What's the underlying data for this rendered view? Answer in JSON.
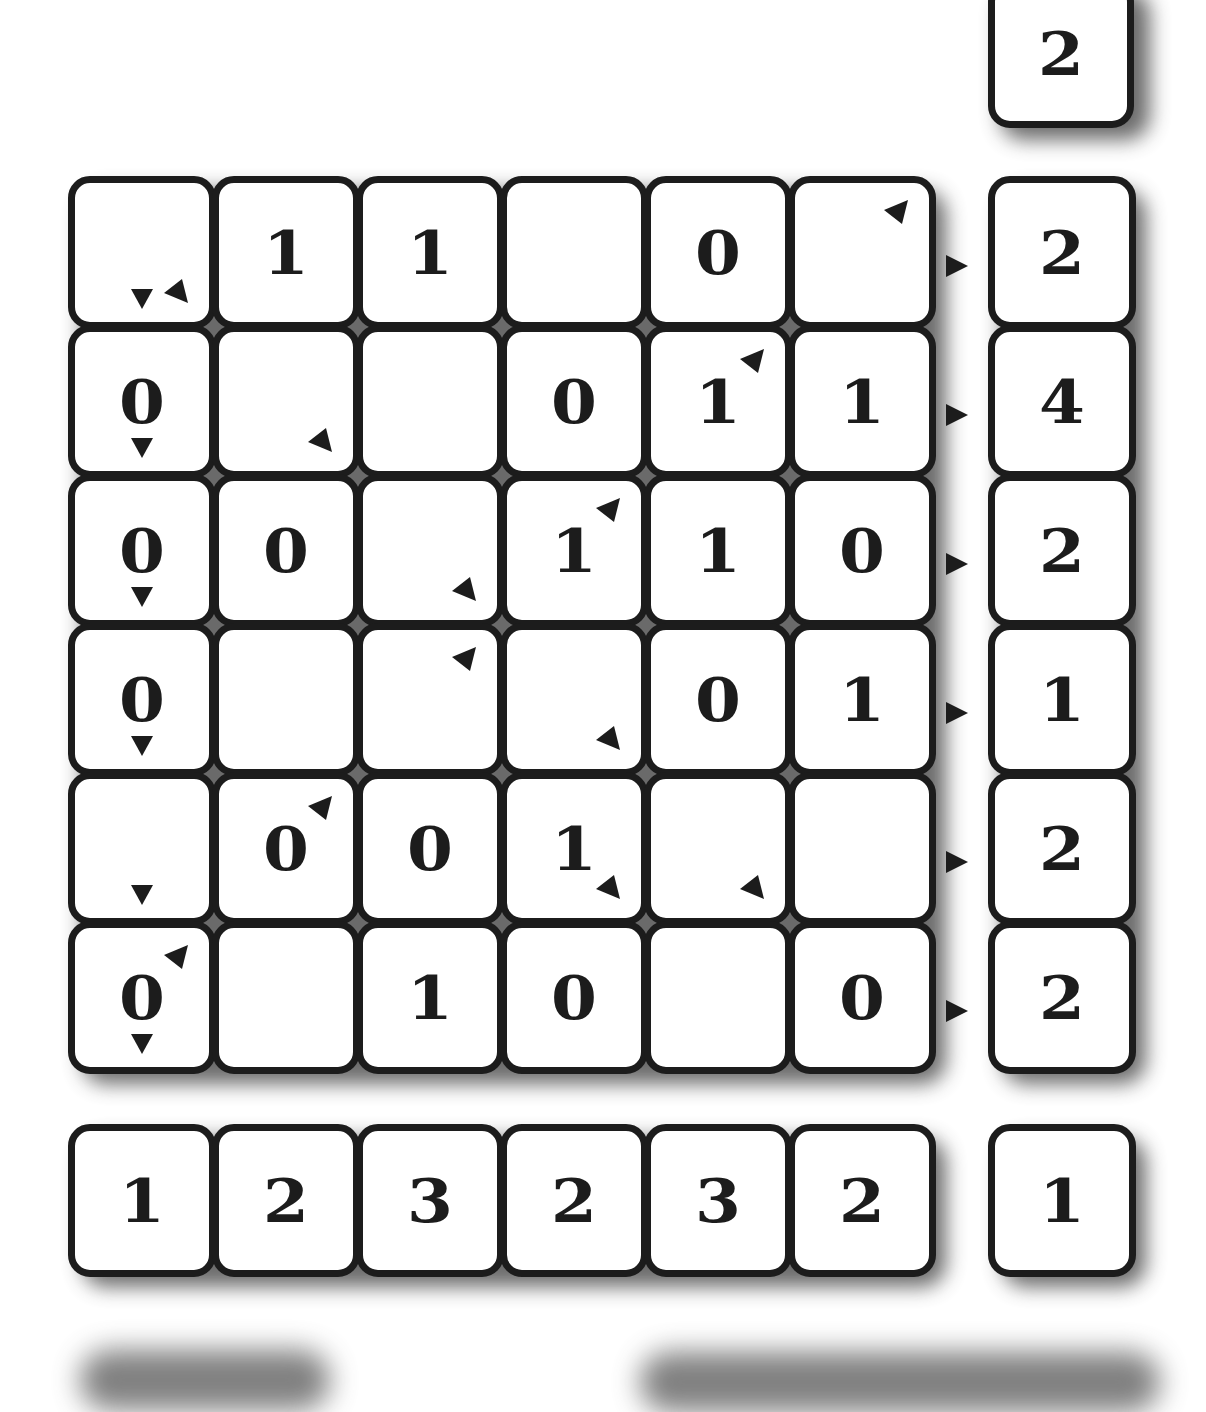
{
  "puzzle": {
    "rows": 6,
    "cols": 6,
    "grid": [
      [
        "",
        "1",
        "1",
        "",
        "0",
        ""
      ],
      [
        "0",
        "",
        "",
        "0",
        "1",
        "1"
      ],
      [
        "0",
        "0",
        "",
        "1",
        "1",
        "0"
      ],
      [
        "0",
        "",
        "",
        "",
        "0",
        "1"
      ],
      [
        "",
        "0",
        "0",
        "1",
        "",
        ""
      ],
      [
        "0",
        "",
        "1",
        "0",
        "",
        "0"
      ]
    ],
    "markers": [
      [
        [
          "down",
          "br"
        ],
        [],
        [],
        [],
        [],
        [
          "tr"
        ]
      ],
      [
        [
          "down"
        ],
        [
          "br"
        ],
        [],
        [],
        [
          "tr"
        ],
        []
      ],
      [
        [
          "down"
        ],
        [],
        [
          "br"
        ],
        [
          "tr"
        ],
        [],
        []
      ],
      [
        [
          "down"
        ],
        [],
        [
          "tr"
        ],
        [
          "br"
        ],
        [],
        []
      ],
      [
        [
          "down"
        ],
        [
          "tr"
        ],
        [],
        [
          "br"
        ],
        [
          "br"
        ],
        []
      ],
      [
        [
          "down",
          "tr"
        ],
        [],
        [],
        [],
        [],
        []
      ]
    ],
    "row_clues": [
      "2",
      "4",
      "2",
      "1",
      "2",
      "2"
    ],
    "col_clues": [
      "1",
      "2",
      "3",
      "2",
      "3",
      "2"
    ],
    "corner_clue": "1",
    "top_clue": "2",
    "row_arrow_icon": "arrow-right-icon"
  },
  "colors": {
    "tile_border": "#1c1c1c",
    "tile_fill": "#ffffff",
    "shadow": "#3a3a3a",
    "background": "#ffffff"
  }
}
